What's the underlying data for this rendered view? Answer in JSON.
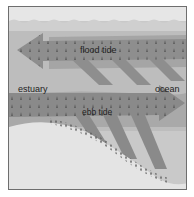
{
  "diagram": {
    "labels": {
      "flood_tide": "flood tide",
      "ebb_tide": "ebb tide",
      "estuary": "estuary",
      "ocean": "ocean"
    },
    "colors": {
      "sky": "#e6e6e6",
      "water": "#bcbcbc",
      "arrow": "#8a8a8a",
      "sand": "#e4e4e4",
      "border": "#6e6e6e"
    }
  }
}
